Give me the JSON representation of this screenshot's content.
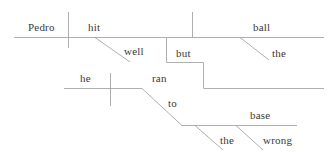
{
  "diagram": {
    "type": "reed-kellogg-sentence-diagram",
    "sentence": "Pedro hit the ball well, but he ran to the wrong base.",
    "stroke_color": "#9a9a9a",
    "text_color": "#3a3a3a",
    "background_color": "#ffffff",
    "words": {
      "subject_clause1": "Pedro",
      "verb_clause1": "hit",
      "adverb_clause1": "well",
      "object_clause1": "ball",
      "object_article_clause1": "the",
      "conjunction": "but",
      "subject_clause2": "he",
      "verb_clause2": "ran",
      "preposition": "to",
      "prep_object": "base",
      "prep_object_article": "the",
      "prep_object_adjective": "wrong"
    },
    "labels": [
      {
        "name": "pedro",
        "text": "Pedro",
        "x": 28,
        "y": 22,
        "role": "subject"
      },
      {
        "name": "hit",
        "text": "hit",
        "x": 88,
        "y": 22,
        "role": "verb"
      },
      {
        "name": "ball",
        "text": "ball",
        "x": 253,
        "y": 22,
        "role": "direct-object"
      },
      {
        "name": "well",
        "text": "well",
        "x": 124,
        "y": 46,
        "role": "adverb"
      },
      {
        "name": "but",
        "text": "but",
        "x": 176,
        "y": 48,
        "role": "coordinating-conjunction"
      },
      {
        "name": "the-ball",
        "text": "the",
        "x": 272,
        "y": 48,
        "role": "article"
      },
      {
        "name": "he",
        "text": "he",
        "x": 80,
        "y": 73,
        "role": "subject"
      },
      {
        "name": "ran",
        "text": "ran",
        "x": 152,
        "y": 73,
        "role": "verb"
      },
      {
        "name": "to",
        "text": "to",
        "x": 168,
        "y": 98,
        "role": "preposition"
      },
      {
        "name": "base",
        "text": "base",
        "x": 250,
        "y": 110,
        "role": "object-of-preposition"
      },
      {
        "name": "the-base",
        "text": "the",
        "x": 220,
        "y": 135,
        "role": "article"
      },
      {
        "name": "wrong",
        "text": "wrong",
        "x": 263,
        "y": 135,
        "role": "adjective"
      }
    ]
  }
}
